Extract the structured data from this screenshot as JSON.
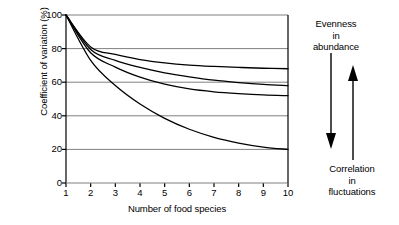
{
  "chart_data": {
    "type": "line",
    "title": "",
    "xlabel": "Number of food species",
    "ylabel": "Coefficient of variation (%)",
    "xlim": [
      1,
      10
    ],
    "ylim": [
      0,
      100
    ],
    "grid": true,
    "grid_axis": "y",
    "legend": "none",
    "xticks": [
      "1",
      "2",
      "3",
      "4",
      "5",
      "6",
      "7",
      "8",
      "9",
      "10"
    ],
    "yticks": [
      "0",
      "20",
      "40",
      "60",
      "80",
      "100"
    ],
    "x": [
      1,
      2,
      3,
      4,
      5,
      6,
      7,
      8,
      9,
      10
    ],
    "series": [
      {
        "name": "curve-1",
        "values": [
          100,
          81,
          76.5,
          73.5,
          71.5,
          70.2,
          69.4,
          68.8,
          68.3,
          68
        ]
      },
      {
        "name": "curve-2",
        "values": [
          100,
          79.5,
          73,
          68.8,
          65.6,
          63.2,
          61.2,
          59.8,
          58.7,
          58
        ]
      },
      {
        "name": "curve-3",
        "values": [
          100,
          77.5,
          69,
          63,
          58.8,
          56,
          54.3,
          53.2,
          52.4,
          52
        ]
      },
      {
        "name": "curve-4",
        "values": [
          100,
          73,
          58,
          47,
          38.5,
          32,
          27.2,
          23.8,
          21.4,
          20
        ]
      }
    ]
  },
  "annotations": {
    "top": {
      "line1": "Evenness",
      "line2": "in",
      "line3": "abundance",
      "arrow": "down-arrow"
    },
    "bottom": {
      "line1": "Correlation",
      "line2": "in",
      "line3": "fluctuations",
      "arrow": "up-arrow"
    }
  },
  "colors": {
    "curve": "#000000",
    "axis": "#000000",
    "grid": "#808080",
    "background": "#ffffff"
  }
}
